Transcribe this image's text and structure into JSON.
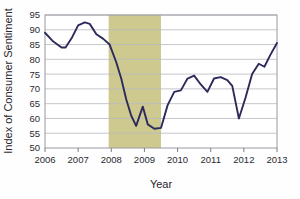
{
  "chart_data": {
    "type": "line",
    "title": "",
    "xlabel": "Year",
    "ylabel": "Index of Consumer Sentiment",
    "xlim": [
      2006,
      2013
    ],
    "ylim": [
      50,
      95
    ],
    "yticks": [
      50,
      55,
      60,
      65,
      70,
      75,
      80,
      85,
      90,
      95
    ],
    "ytick_labels": [
      "50",
      "55",
      "60",
      "65",
      "70",
      "75",
      "80",
      "85",
      "90",
      "95"
    ],
    "xticks": [
      2006,
      2007,
      2008,
      2009,
      2010,
      2011,
      2012,
      2013
    ],
    "xtick_labels": [
      "2006",
      "2007",
      "2008",
      "2009",
      "2010",
      "2011",
      "2012",
      "2013"
    ],
    "grid": true,
    "grid_axis": "y",
    "legend": false,
    "line_color": "#2d2a5c",
    "shaded_region": {
      "label": "recession",
      "x_start": 2007.92,
      "x_end": 2009.5,
      "color": "#cdc98f"
    },
    "series": [
      {
        "name": "Index of Consumer Sentiment",
        "x": [
          2006.0,
          2006.25,
          2006.5,
          2006.62,
          2006.82,
          2007.0,
          2007.2,
          2007.35,
          2007.55,
          2007.75,
          2007.95,
          2008.15,
          2008.3,
          2008.45,
          2008.6,
          2008.75,
          2008.95,
          2009.1,
          2009.3,
          2009.5,
          2009.7,
          2009.9,
          2010.1,
          2010.3,
          2010.5,
          2010.7,
          2010.9,
          2011.1,
          2011.3,
          2011.5,
          2011.65,
          2011.85,
          2012.05,
          2012.25,
          2012.45,
          2012.62,
          2012.8,
          2013.0
        ],
        "y": [
          89.0,
          86.0,
          84.0,
          84.0,
          87.5,
          91.5,
          92.5,
          92.0,
          88.5,
          87.0,
          85.0,
          79.0,
          73.5,
          66.5,
          61.0,
          57.5,
          64.0,
          58.0,
          56.5,
          56.8,
          64.5,
          69.0,
          69.5,
          73.5,
          74.5,
          71.5,
          69.0,
          73.5,
          74.0,
          73.0,
          71.0,
          60.0,
          67.0,
          75.0,
          78.5,
          77.5,
          81.5,
          85.5
        ]
      }
    ]
  },
  "axis": {
    "ylabel": "Index of Consumer Sentiment",
    "xlabel": "Year"
  }
}
